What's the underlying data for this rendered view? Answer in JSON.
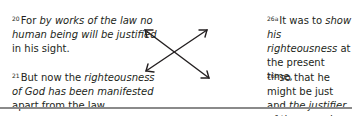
{
  "verses": {
    "v20": {
      "num": "20",
      "pre": "For ",
      "it1": "by works of the law no human being will be justified",
      "post": " in his sight."
    },
    "v21": {
      "num": "21",
      "pre": "But now the ",
      "it1": "righteousness of God has been manifested",
      "post": " apart from the law."
    },
    "v26a": {
      "num": "26a",
      "pre": "It was to ",
      "it1": "show his righteousness",
      "post": " at the present time,"
    },
    "v26b": {
      "num": "26b",
      "pre": "so that he might be just and ",
      "it1": "the justifier of the one who has faith in Jesus.",
      "post": ""
    }
  },
  "diagram": {
    "type": "crossing-double-arrows",
    "color": "#231f20"
  }
}
